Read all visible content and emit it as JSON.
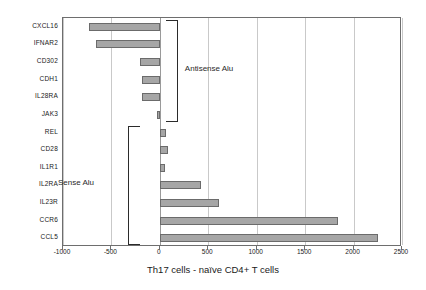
{
  "chart_data": {
    "type": "bar",
    "orientation": "horizontal",
    "title": "",
    "xlabel": "Th17 cells - naïve CD4+ T cells",
    "ylabel": "",
    "xlim": [
      -1000,
      2500
    ],
    "xticks": [
      -1000,
      -500,
      0,
      500,
      1000,
      1500,
      2000,
      2500
    ],
    "xticklabels": [
      "-1000",
      "-500",
      "0",
      "500",
      "1000",
      "1500",
      "2000",
      "2500"
    ],
    "grid": true,
    "legend": "none",
    "categories": [
      "CXCL16",
      "IFNAR2",
      "CD302",
      "CDH1",
      "IL28RA",
      "JAK3",
      "REL",
      "CD28",
      "IL1R1",
      "IL2RA",
      "IL23R",
      "CCR6",
      "CCL5"
    ],
    "values": [
      -730,
      -660,
      -200,
      -180,
      -180,
      -30,
      60,
      85,
      50,
      420,
      610,
      1840,
      2250
    ],
    "bar_color": "#a6a6a6",
    "bar_edge_color": "#6b6b6b",
    "annotations": [
      {
        "text": "Antisense Alu",
        "group": [
          "CXCL16",
          "IFNAR2",
          "CD302",
          "CDH1",
          "IL28RA",
          "JAK3"
        ]
      },
      {
        "text": "Sense Alu",
        "group": [
          "REL",
          "CD28",
          "IL1R1",
          "IL2RA",
          "IL23R",
          "CCR6",
          "CCL5"
        ]
      }
    ]
  },
  "axis": {
    "title": "Th17 cells - naïve CD4+ T cells"
  },
  "annotations": {
    "antisense": "Antisense Alu",
    "sense": "Sense Alu"
  }
}
